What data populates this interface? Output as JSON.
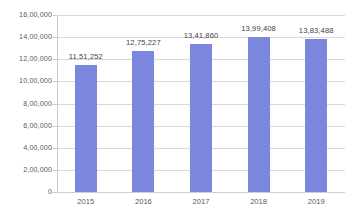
{
  "chart_data": {
    "type": "bar",
    "title": "",
    "subtitle": "",
    "xlabel": "",
    "ylabel": "",
    "categories": [
      "2015",
      "2016",
      "2017",
      "2018",
      "2019"
    ],
    "values": [
      1151252,
      1275227,
      1341860,
      1399408,
      1383488
    ],
    "value_labels": [
      "11,51,252",
      "12,75,227",
      "13,41,860",
      "13,99,408",
      "13,83,488"
    ],
    "series": [
      {
        "name": "",
        "values": [
          1151252,
          1275227,
          1341860,
          1399408,
          1383488
        ]
      }
    ],
    "ylim": [
      0,
      1600000
    ],
    "ytick_values": [
      0,
      200000,
      400000,
      600000,
      800000,
      1000000,
      1200000,
      1400000,
      1600000
    ],
    "ytick_labels": [
      "0",
      "2,00,000",
      "4,00,000",
      "6,00,000",
      "8,00,000",
      "10,00,000",
      "12,00,000",
      "14,00,000",
      "16,00,000"
    ],
    "grid": "horizontal",
    "legend": "none",
    "annotations": [],
    "colors": {
      "bar": "#7b87dc",
      "gridline": "#d9d9d9",
      "axis": "#c8c8c8",
      "tick_label": "#595959",
      "data_label": "#3f3f3f",
      "background": "#ffffff"
    }
  }
}
